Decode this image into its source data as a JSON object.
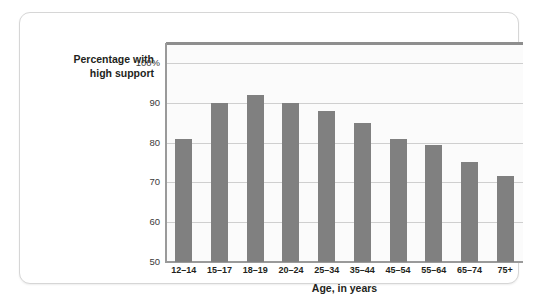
{
  "chart_data": {
    "type": "bar",
    "title": "",
    "ylabel": "Percentage with high support",
    "ylabel_lines": [
      "Percentage with",
      "high support"
    ],
    "xlabel": "Age, in years",
    "categories": [
      "12–14",
      "15–17",
      "18–19",
      "20–24",
      "25–34",
      "35–44",
      "45–54",
      "55–64",
      "65–74",
      "75+"
    ],
    "values": [
      81,
      90,
      92,
      90,
      88,
      85,
      81,
      79.5,
      75,
      71.5
    ],
    "ylim": [
      50,
      105
    ],
    "yticks": [
      50,
      60,
      70,
      80,
      90,
      100
    ],
    "ytick_labels": [
      "50",
      "60",
      "70",
      "80",
      "90",
      "100%"
    ],
    "grid": true,
    "legend": "none",
    "bar_color": "#808080",
    "plot_background": "#fbfbfb",
    "gridline_color": "#cfcfcf",
    "axis_color": "#9a9a9a",
    "frame_top_color": "#8e8e8e",
    "card_background": "#ffffff",
    "card_border_color": "#d6d6d6",
    "text_color": "#231f20"
  }
}
